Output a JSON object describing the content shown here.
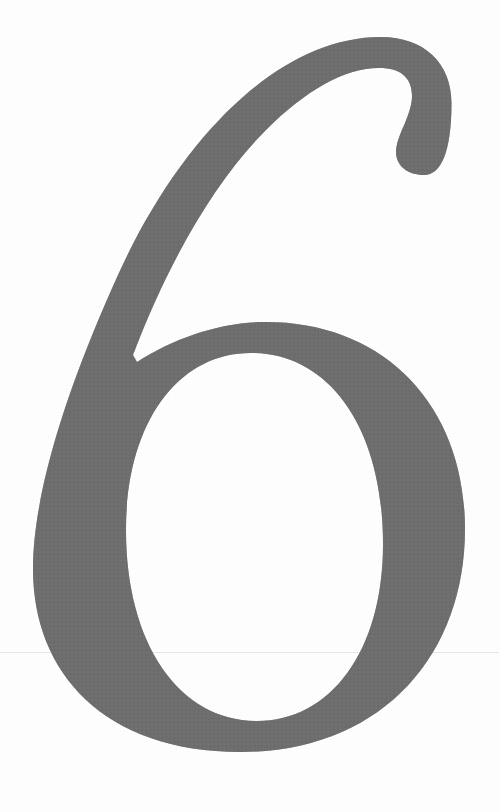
{
  "page": {
    "width": 499,
    "height": 812,
    "background_color": "#fefefe",
    "kind": "scanned-book-page"
  },
  "glyph": {
    "character": "6",
    "name": "numeral-six",
    "role": "chapter-number",
    "style": "serif-oldstyle-display",
    "color": "#6e6e6e",
    "bounds": {
      "left": 33,
      "top": 37,
      "right": 465,
      "bottom": 752
    },
    "features": {
      "top_terminal": "teardrop-ball",
      "counter": "vertical-oval",
      "notch_point": {
        "x": 133,
        "y": 355
      }
    }
  },
  "artifacts": {
    "scan_line": {
      "y": 652,
      "color": "#787878",
      "opacity": 0.16
    },
    "paper_grain": true
  }
}
